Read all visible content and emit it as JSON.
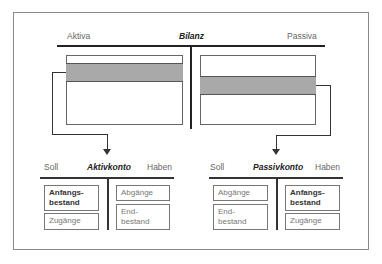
{
  "bilanz": {
    "title": "Bilanz",
    "left_label": "Aktiva",
    "right_label": "Passiva"
  },
  "aktivkonto": {
    "title": "Aktivkonto",
    "left_label": "Soll",
    "right_label": "Haben",
    "soll_items": [
      {
        "line1": "Anfangs-",
        "line2": "bestand",
        "bold": true
      },
      {
        "line1": "Zugänge",
        "line2": "",
        "bold": false
      }
    ],
    "haben_items": [
      {
        "line1": "Abgänge",
        "line2": "",
        "bold": false
      },
      {
        "line1": "End-",
        "line2": "bestand",
        "bold": false
      }
    ]
  },
  "passivkonto": {
    "title": "Passivkonto",
    "left_label": "Soll",
    "right_label": "Haben",
    "soll_items": [
      {
        "line1": "Abgänge",
        "line2": "",
        "bold": false
      },
      {
        "line1": "End-",
        "line2": "bestand",
        "bold": false
      }
    ],
    "haben_items": [
      {
        "line1": "Anfangs-",
        "line2": "bestand",
        "bold": true
      },
      {
        "line1": "Zugänge",
        "line2": "",
        "bold": false
      }
    ]
  },
  "colors": {
    "highlight_band": "#a9a9a9",
    "line": "#222222"
  }
}
